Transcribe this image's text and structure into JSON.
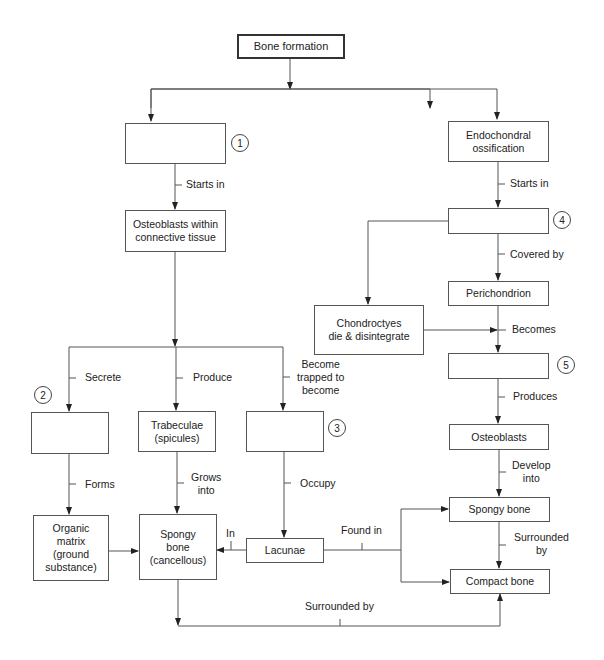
{
  "diagram": {
    "title": "Bone formation",
    "boxes": {
      "bone_formation": "Bone formation",
      "box1": "",
      "osteoblasts_ct": "Osteoblasts within\nconnective tissue",
      "endochondral": "Endochondral\nossification",
      "box4": "",
      "perichondrion": "Perichondrion",
      "chondrocytes": "Chondroctyes\ndie & disintegrate",
      "box5": "",
      "osteoblasts_r": "Osteoblasts",
      "spongy_r": "Spongy bone",
      "compact": "Compact bone",
      "box2": "",
      "trabeculae": "Trabeculae\n(spicules)",
      "box3": "",
      "organic_matrix": "Organic\nmatrix\n(ground\nsubstance)",
      "spongy_l": "Spongy\nbone\n(cancellous)",
      "lacunae": "Lacunae"
    },
    "numbers": [
      "1",
      "2",
      "3",
      "4",
      "5"
    ],
    "labels": {
      "starts_in_l": "Starts in",
      "starts_in_r": "Starts in",
      "covered_by": "Covered by",
      "becomes": "Becomes",
      "produces": "Produces",
      "develop_into": "Develop\ninto",
      "surrounded_by_r": "Surrounded\nby",
      "secrete": "Secrete",
      "produce": "Produce",
      "become_trapped": "Become\ntrapped to\nbecome",
      "forms": "Forms",
      "grows_into": "Grows\ninto",
      "occupy": "Occupy",
      "in": "In",
      "found_in": "Found in",
      "surrounded_by_bottom": "Surrounded by"
    }
  }
}
